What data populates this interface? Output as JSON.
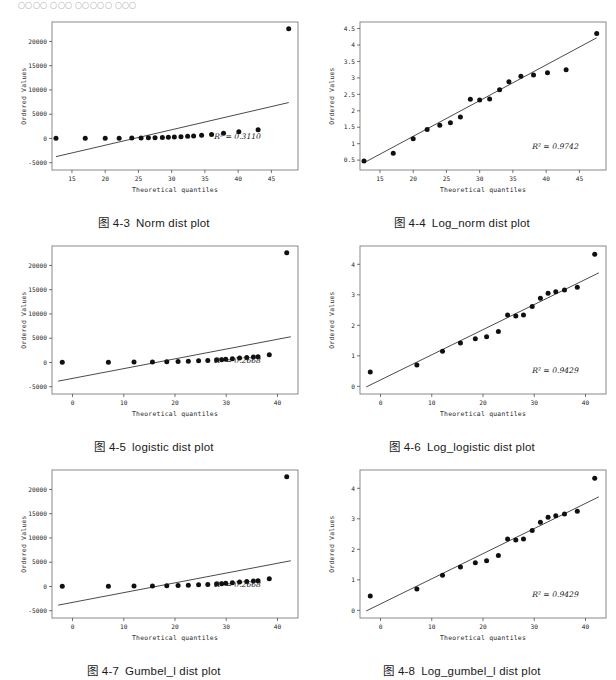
{
  "page": {
    "header_faint_text": "〇〇〇〇 〇〇〇 〇〇〇〇〇 〇〇〇"
  },
  "figures": [
    {
      "id": "fig-4-3",
      "caption_number": "图 4-3",
      "caption_title": "Norm dist plot",
      "r2_label": "R² = 0.3110",
      "chart_data": {
        "type": "scatter",
        "title": "Norm dist plot",
        "xlabel": "Theoretical quantiles",
        "ylabel": "Ordered Values",
        "xlim": [
          12,
          49
        ],
        "ylim": [
          -6500,
          24000
        ],
        "xticks": [
          15,
          20,
          25,
          30,
          35,
          40,
          45
        ],
        "yticks": [
          -5000,
          0,
          5000,
          10000,
          15000,
          20000
        ],
        "grid": false,
        "legend": "none",
        "annotation": "R² = 0.3110",
        "x": [
          12.6,
          17.0,
          20.0,
          22.1,
          24.0,
          25.4,
          26.5,
          27.5,
          28.6,
          29.5,
          30.4,
          31.4,
          32.4,
          33.3,
          34.5,
          36.0,
          37.8,
          40.1,
          43.0,
          47.6
        ],
        "y": [
          20,
          30,
          45,
          60,
          80,
          110,
          140,
          170,
          210,
          260,
          310,
          370,
          430,
          520,
          640,
          830,
          1050,
          1380,
          1780,
          22600
        ],
        "fit_line": {
          "x0": 12.6,
          "y0": -3750,
          "x1": 47.6,
          "y1": 7400
        }
      }
    },
    {
      "id": "fig-4-4",
      "caption_number": "图 4-4",
      "caption_title": "Log_norm dist plot",
      "r2_label": "R² = 0.9742",
      "chart_data": {
        "type": "scatter",
        "title": "Log_norm dist plot",
        "xlabel": "Theoretical quantiles",
        "ylabel": "Ordered Values",
        "xlim": [
          12,
          49
        ],
        "ylim": [
          0.2,
          4.7
        ],
        "xticks": [
          15,
          20,
          25,
          30,
          35,
          40,
          45
        ],
        "yticks": [
          0.5,
          1.0,
          1.5,
          2.0,
          2.5,
          3.0,
          3.5,
          4.0,
          4.5
        ],
        "grid": false,
        "legend": "none",
        "annotation": "R² = 0.9742",
        "x": [
          12.6,
          17.0,
          20.0,
          22.1,
          24.0,
          25.6,
          27.1,
          28.6,
          30.0,
          31.5,
          33.0,
          34.4,
          36.2,
          38.1,
          40.2,
          43.0,
          47.6
        ],
        "y": [
          0.47,
          0.71,
          1.15,
          1.43,
          1.56,
          1.64,
          1.81,
          2.35,
          2.33,
          2.36,
          2.64,
          2.88,
          3.05,
          3.09,
          3.16,
          3.25,
          4.35
        ],
        "fit_line": {
          "x0": 12.6,
          "y0": 0.42,
          "x1": 47.6,
          "y1": 4.22
        }
      }
    },
    {
      "id": "fig-4-5",
      "caption_number": "图 4-5",
      "caption_title": "logistic dist plot",
      "r2_label": "R² = 0.2668",
      "chart_data": {
        "type": "scatter",
        "title": "logistic dist plot",
        "xlabel": "Theoretical quantiles",
        "ylabel": "Ordered Values",
        "xlim": [
          -4,
          44
        ],
        "ylim": [
          -6500,
          24000
        ],
        "xticks": [
          0,
          10,
          20,
          30,
          40
        ],
        "yticks": [
          -5000,
          0,
          5000,
          10000,
          15000,
          20000
        ],
        "grid": false,
        "legend": "none",
        "annotation": "R² = 0.2668",
        "x": [
          -2.0,
          7.0,
          12.0,
          15.6,
          18.4,
          20.6,
          22.6,
          24.6,
          26.4,
          28.1,
          29.1,
          29.9,
          31.2,
          32.6,
          34.0,
          35.3,
          36.2,
          38.4,
          41.8
        ],
        "y": [
          20,
          40,
          70,
          110,
          160,
          210,
          270,
          340,
          420,
          520,
          560,
          640,
          760,
          900,
          1030,
          1120,
          1180,
          1600,
          22600
        ],
        "fit_line": {
          "x0": -2.8,
          "y0": -3850,
          "x1": 42.6,
          "y1": 5300
        }
      }
    },
    {
      "id": "fig-4-6",
      "caption_number": "图 4-6",
      "caption_title": "Log_logistic dist plot",
      "r2_label": "R² = 0.9429",
      "chart_data": {
        "type": "scatter",
        "title": "Log_logistic dist plot",
        "xlabel": "Theoretical quantiles",
        "ylabel": "Ordered Values",
        "xlim": [
          -4,
          44
        ],
        "ylim": [
          -0.25,
          4.6
        ],
        "xticks": [
          0,
          10,
          20,
          30,
          40
        ],
        "yticks": [
          0,
          1,
          2,
          3,
          4
        ],
        "grid": false,
        "legend": "none",
        "annotation": "R² = 0.9429",
        "x": [
          -2.0,
          7.1,
          12.1,
          15.6,
          18.5,
          20.7,
          23.0,
          24.8,
          26.4,
          27.9,
          29.6,
          31.2,
          32.7,
          34.2,
          35.9,
          38.4,
          41.8
        ],
        "y": [
          0.47,
          0.7,
          1.15,
          1.42,
          1.56,
          1.63,
          1.8,
          2.34,
          2.31,
          2.34,
          2.62,
          2.89,
          3.05,
          3.1,
          3.16,
          3.25,
          4.33
        ],
        "fit_line": {
          "x0": -2.8,
          "y0": -0.02,
          "x1": 42.6,
          "y1": 3.72
        }
      }
    },
    {
      "id": "fig-4-7",
      "caption_number": "图 4-7",
      "caption_title": "Gumbel_l dist plot",
      "r2_label": "R² = 0.2668",
      "chart_data": {
        "type": "scatter",
        "title": "Gumbel_l dist plot",
        "xlabel": "Theoretical quantiles",
        "ylabel": "Ordered Values",
        "xlim": [
          -4,
          44
        ],
        "ylim": [
          -6500,
          24000
        ],
        "xticks": [
          0,
          10,
          20,
          30,
          40
        ],
        "yticks": [
          -5000,
          0,
          5000,
          10000,
          15000,
          20000
        ],
        "grid": false,
        "legend": "none",
        "annotation": "R² = 0.2668",
        "x": [
          -2.0,
          7.0,
          12.0,
          15.6,
          18.4,
          20.6,
          22.6,
          24.6,
          26.4,
          28.1,
          29.1,
          29.9,
          31.2,
          32.6,
          34.0,
          35.3,
          36.2,
          38.4,
          41.8
        ],
        "y": [
          20,
          40,
          70,
          110,
          160,
          210,
          270,
          340,
          420,
          520,
          560,
          640,
          760,
          900,
          1030,
          1120,
          1180,
          1600,
          22600
        ],
        "fit_line": {
          "x0": -2.8,
          "y0": -3850,
          "x1": 42.6,
          "y1": 5300
        }
      }
    },
    {
      "id": "fig-4-8",
      "caption_number": "图 4-8",
      "caption_title": "Log_gumbel_l dist plot",
      "r2_label": "R² = 0.9429",
      "chart_data": {
        "type": "scatter",
        "title": "Log_gumbel_l dist plot",
        "xlabel": "Theoretical quantiles",
        "ylabel": "Ordered Values",
        "xlim": [
          -4,
          44
        ],
        "ylim": [
          -0.25,
          4.6
        ],
        "xticks": [
          0,
          10,
          20,
          30,
          40
        ],
        "yticks": [
          0,
          1,
          2,
          3,
          4
        ],
        "grid": false,
        "legend": "none",
        "annotation": "R² = 0.9429",
        "x": [
          -2.0,
          7.1,
          12.1,
          15.6,
          18.5,
          20.7,
          23.0,
          24.8,
          26.4,
          27.9,
          29.6,
          31.2,
          32.7,
          34.2,
          35.9,
          38.4,
          41.8
        ],
        "y": [
          0.47,
          0.7,
          1.15,
          1.42,
          1.56,
          1.63,
          1.8,
          2.34,
          2.31,
          2.34,
          2.62,
          2.89,
          3.05,
          3.1,
          3.16,
          3.25,
          4.33
        ],
        "fit_line": {
          "x0": -2.8,
          "y0": -0.02,
          "x1": 42.6,
          "y1": 3.72
        }
      }
    }
  ]
}
